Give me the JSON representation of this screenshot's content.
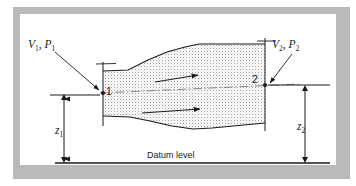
{
  "figure": {
    "background_color": "#ffffff",
    "frame_color": "#b9b9b9",
    "panel_color": "#ffffff",
    "line_color": "#1a1a1a",
    "stipple_color": "#9a9a9a"
  },
  "labels": {
    "inlet_state": "V",
    "inlet_state_sub": "1",
    "inlet_pressure": "P",
    "inlet_pressure_sub": "1",
    "inlet_state_full": "V1, P1",
    "outlet_state": "V",
    "outlet_state_sub": "2",
    "outlet_pressure": "P",
    "outlet_pressure_sub": "2",
    "outlet_state_full": "V2, P2",
    "station_one": "1",
    "station_two": "2",
    "elevation_one": "z",
    "elevation_one_sub": "1",
    "elevation_two": "z",
    "elevation_two_sub": "2",
    "datum": "Datum level"
  },
  "geometry": {
    "pipe_top_profile": "103,71 128,70 148,60 167,52 185,47 199,44 265,44",
    "pipe_bottom_profile": "103,116 130,117 150,121 172,126 193,129 212,128 265,123",
    "centerline": "100,93 268,85",
    "station_one_x": 103,
    "station_one_top": 64,
    "station_one_bottom": 124,
    "station_two_x": 265,
    "station_two_top": 38,
    "station_two_bottom": 130,
    "datum_y": 163,
    "datum_x_start": 55,
    "datum_x_end": 330,
    "z1_x": 64,
    "z1_top": 95,
    "z1_bottom": 163,
    "z2_x": 305,
    "z2_top": 85,
    "z2_bottom": 163,
    "point_one": [
      103,
      93
    ],
    "point_two": [
      265,
      85
    ],
    "flow_arrow_upper": "155,81 200,74",
    "flow_arrow_lower": "145,112 202,108",
    "leader_one": "56,53 98,91",
    "leader_two": "288,53 270,83"
  },
  "annotations": {
    "flow_direction": "left-to-right",
    "section_type": "diverging",
    "elevation_reference": "Datum level"
  }
}
